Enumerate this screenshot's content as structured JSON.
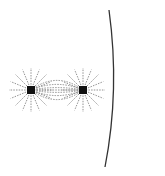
{
  "diagram": {
    "charges": [
      {
        "id": "charge-left",
        "x": 31,
        "y": 90,
        "color": "#111111"
      },
      {
        "id": "charge-right",
        "x": 83,
        "y": 90,
        "color": "#111111"
      }
    ],
    "field_line_color": "#777777",
    "surface": {
      "color": "#333333",
      "points": [
        [
          109,
          10
        ],
        [
          116,
          90
        ],
        [
          105,
          167
        ]
      ]
    },
    "ray_count": 16,
    "ray_length": 22
  }
}
